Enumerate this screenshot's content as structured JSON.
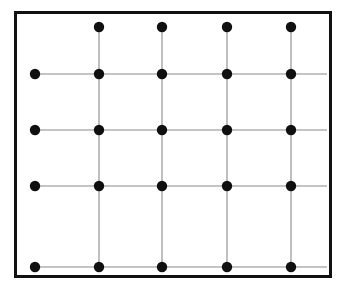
{
  "figure": {
    "name": "lattice-grid-diagram",
    "width": 351,
    "height": 291,
    "background_color": "#ffffff"
  },
  "frame": {
    "name": "outer-rectangle-border",
    "x": 14,
    "y": 11,
    "width": 318,
    "height": 267,
    "stroke_color": "#111111",
    "stroke_width": 3
  },
  "chart_data": {
    "type": "scatter",
    "title": "",
    "subtitle": "",
    "xlabel": "",
    "ylabel": "",
    "grid": true,
    "legend": null,
    "xlim": [
      0,
      4
    ],
    "ylim": [
      0,
      4
    ],
    "columns": 5,
    "rows": 5,
    "column_x": [
      35,
      99,
      162,
      227,
      291
    ],
    "row_y": [
      27,
      74,
      130,
      186,
      267
    ],
    "dot_color": "#101010",
    "dot_radius": 5.2,
    "line_color": "#8a8a8a",
    "line_width": 1.1,
    "points": [
      {
        "col": 1,
        "row": 0,
        "x": 99,
        "y": 27,
        "present": true
      },
      {
        "col": 2,
        "row": 0,
        "x": 162,
        "y": 27,
        "present": true
      },
      {
        "col": 3,
        "row": 0,
        "x": 227,
        "y": 27,
        "present": true
      },
      {
        "col": 4,
        "row": 0,
        "x": 291,
        "y": 27,
        "present": true
      },
      {
        "col": 0,
        "row": 1,
        "x": 35,
        "y": 74,
        "present": true
      },
      {
        "col": 1,
        "row": 1,
        "x": 99,
        "y": 74,
        "present": true
      },
      {
        "col": 2,
        "row": 1,
        "x": 162,
        "y": 74,
        "present": true
      },
      {
        "col": 3,
        "row": 1,
        "x": 227,
        "y": 74,
        "present": true
      },
      {
        "col": 4,
        "row": 1,
        "x": 291,
        "y": 74,
        "present": true
      },
      {
        "col": 0,
        "row": 2,
        "x": 35,
        "y": 130,
        "present": true
      },
      {
        "col": 1,
        "row": 2,
        "x": 99,
        "y": 130,
        "present": true
      },
      {
        "col": 2,
        "row": 2,
        "x": 162,
        "y": 130,
        "present": true
      },
      {
        "col": 3,
        "row": 2,
        "x": 227,
        "y": 130,
        "present": true
      },
      {
        "col": 4,
        "row": 2,
        "x": 291,
        "y": 130,
        "present": true
      },
      {
        "col": 0,
        "row": 3,
        "x": 35,
        "y": 186,
        "present": true
      },
      {
        "col": 1,
        "row": 3,
        "x": 99,
        "y": 186,
        "present": true
      },
      {
        "col": 2,
        "row": 3,
        "x": 162,
        "y": 186,
        "present": true
      },
      {
        "col": 3,
        "row": 3,
        "x": 227,
        "y": 186,
        "present": true
      },
      {
        "col": 4,
        "row": 3,
        "x": 291,
        "y": 186,
        "present": true
      },
      {
        "col": 0,
        "row": 4,
        "x": 35,
        "y": 267,
        "present": true
      },
      {
        "col": 1,
        "row": 4,
        "x": 99,
        "y": 267,
        "present": true
      },
      {
        "col": 2,
        "row": 4,
        "x": 162,
        "y": 267,
        "present": true
      },
      {
        "col": 3,
        "row": 4,
        "x": 227,
        "y": 267,
        "present": true
      },
      {
        "col": 4,
        "row": 4,
        "x": 291,
        "y": 267,
        "present": true
      }
    ],
    "missing_points": [
      {
        "col": 0,
        "row": 0,
        "x": 35,
        "y": 27,
        "note": "vacant lattice site at upper-left"
      }
    ],
    "horizontal_lines": [
      {
        "row": 1,
        "y": 74,
        "x1": 35,
        "x2": 327
      },
      {
        "row": 2,
        "y": 130,
        "x1": 35,
        "x2": 327
      },
      {
        "row": 3,
        "y": 186,
        "x1": 35,
        "x2": 327
      },
      {
        "row": 4,
        "y": 267,
        "x1": 35,
        "x2": 327
      }
    ],
    "vertical_lines": [
      {
        "col": 1,
        "x": 99,
        "y1": 27,
        "y2": 267
      },
      {
        "col": 2,
        "x": 162,
        "y1": 27,
        "y2": 267
      },
      {
        "col": 3,
        "x": 227,
        "y1": 27,
        "y2": 267
      },
      {
        "col": 4,
        "x": 291,
        "y1": 27,
        "y2": 267
      }
    ],
    "counts": {
      "total_dots": 24,
      "dots_per_row": [
        4,
        5,
        5,
        5,
        5
      ],
      "dots_per_column": [
        4,
        5,
        5,
        5,
        5
      ],
      "horizontal_line_count": 4,
      "vertical_line_count": 4
    }
  }
}
